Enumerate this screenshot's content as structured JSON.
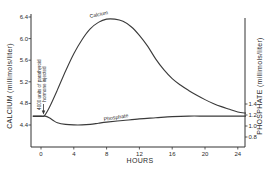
{
  "chart_data": {
    "type": "line",
    "title": "",
    "xlabel": "HOURS",
    "ylabel": "CALCIUM (millimols/liter)",
    "y2label": "PHOSPHATE (millimols/liter)",
    "xlim": [
      -1,
      25
    ],
    "ylim": [
      4.2,
      6.5
    ],
    "y2lim": [
      0.72,
      5.1
    ],
    "x_ticks": [
      0,
      4,
      8,
      12,
      16,
      20,
      24
    ],
    "x_tick_labels": [
      "0",
      "4",
      "8",
      "12",
      "16",
      "20",
      "24"
    ],
    "y_ticks": [
      4.4,
      4.8,
      5.2,
      5.6,
      6.0,
      6.4
    ],
    "y_tick_labels": [
      "4.4",
      "4.8",
      "5.2",
      "5.6",
      "6.0",
      "6.4"
    ],
    "y2_ticks": [
      0.8,
      1.0,
      1.2,
      1.4
    ],
    "y2_tick_labels": [
      "0.8",
      "1.0",
      "1.2",
      "1.4"
    ],
    "grid": false,
    "legend": "none",
    "annotations": [
      {
        "text": "4000 units of parathyroid hormone injected",
        "x": 0.4,
        "y_axis": "left",
        "y": 4.56,
        "type": "arrow"
      }
    ],
    "series": [
      {
        "name": "Calcium",
        "axis": "left",
        "x": [
          -1,
          0,
          0.4,
          1,
          2,
          3,
          4,
          5,
          6,
          7,
          8,
          9,
          10,
          11,
          12,
          13,
          14,
          15,
          16,
          17,
          18,
          19,
          20,
          21,
          22,
          23,
          24,
          25
        ],
        "values": [
          4.56,
          4.56,
          4.57,
          4.72,
          5.05,
          5.4,
          5.72,
          5.98,
          6.18,
          6.3,
          6.36,
          6.36,
          6.32,
          6.22,
          6.06,
          5.86,
          5.62,
          5.42,
          5.26,
          5.14,
          5.04,
          4.95,
          4.87,
          4.8,
          4.74,
          4.69,
          4.64,
          4.62
        ]
      },
      {
        "name": "Phosphate",
        "axis": "right",
        "x": [
          -1,
          0,
          0.5,
          1,
          1.5,
          2,
          3,
          4,
          5,
          6,
          7,
          8,
          10,
          12,
          14,
          16,
          18,
          20,
          22,
          24,
          25
        ],
        "values": [
          1.18,
          1.18,
          1.18,
          1.15,
          1.1,
          1.06,
          1.03,
          1.02,
          1.02,
          1.03,
          1.05,
          1.07,
          1.1,
          1.13,
          1.15,
          1.17,
          1.18,
          1.18,
          1.18,
          1.18,
          1.18
        ]
      }
    ]
  }
}
